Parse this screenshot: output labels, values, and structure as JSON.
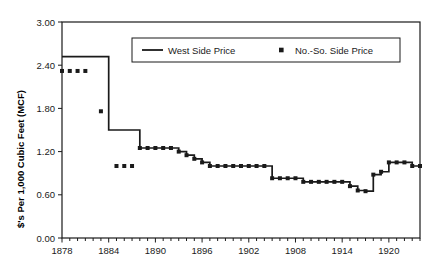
{
  "chart_data": {
    "type": "line",
    "title": "",
    "xlabel": "",
    "ylabel": "$'s Per 1,000 Cubic Feet (MCF)",
    "xlim": [
      1878,
      1924
    ],
    "ylim": [
      0.0,
      3.0
    ],
    "ytick_labels": [
      "0.00",
      "0.60",
      "1.20",
      "1.80",
      "2.40",
      "3.00"
    ],
    "ytick_values": [
      0.0,
      0.6,
      1.2,
      1.8,
      2.4,
      3.0
    ],
    "xtick_labels": [
      "1878",
      "1884",
      "1890",
      "1896",
      "1902",
      "1908",
      "1914",
      "1920"
    ],
    "xtick_values": [
      1878,
      1884,
      1890,
      1896,
      1902,
      1908,
      1914,
      1920
    ],
    "minor_xticks_every": 1,
    "grid": false,
    "legend_position": "top-center",
    "series": [
      {
        "name": "West Side Price",
        "style": "line",
        "color": "#1a1a1a",
        "x": [
          1878,
          1879,
          1880,
          1881,
          1882,
          1883,
          1884,
          1885,
          1886,
          1887,
          1888,
          1889,
          1890,
          1891,
          1892,
          1893,
          1894,
          1895,
          1896,
          1897,
          1898,
          1899,
          1900,
          1901,
          1902,
          1903,
          1904,
          1905,
          1906,
          1907,
          1908,
          1909,
          1910,
          1911,
          1912,
          1913,
          1914,
          1915,
          1916,
          1917,
          1918,
          1919,
          1920,
          1921,
          1922,
          1923,
          1924
        ],
        "y": [
          2.52,
          2.52,
          2.52,
          2.52,
          2.52,
          2.52,
          1.5,
          1.5,
          1.5,
          1.5,
          1.25,
          1.25,
          1.25,
          1.25,
          1.25,
          1.2,
          1.15,
          1.1,
          1.05,
          1.0,
          1.0,
          1.0,
          1.0,
          1.0,
          1.0,
          1.0,
          1.0,
          0.83,
          0.83,
          0.83,
          0.83,
          0.78,
          0.78,
          0.78,
          0.78,
          0.78,
          0.78,
          0.72,
          0.66,
          0.65,
          0.88,
          0.92,
          1.05,
          1.05,
          1.05,
          1.0,
          1.0
        ]
      },
      {
        "name": "No.-So. Side Price",
        "style": "square-markers",
        "color": "#1a1a1a",
        "x": [
          1878,
          1879,
          1880,
          1881,
          1883,
          1885,
          1886,
          1887,
          1888,
          1889,
          1890,
          1891,
          1892,
          1893,
          1894,
          1895,
          1896,
          1897,
          1898,
          1899,
          1900,
          1901,
          1902,
          1903,
          1904,
          1905,
          1906,
          1907,
          1908,
          1909,
          1910,
          1911,
          1912,
          1913,
          1914,
          1915,
          1916,
          1917,
          1918,
          1919,
          1920,
          1921,
          1922,
          1923,
          1924
        ],
        "y": [
          2.32,
          2.32,
          2.32,
          2.32,
          1.76,
          1.0,
          1.0,
          1.0,
          1.25,
          1.25,
          1.25,
          1.25,
          1.25,
          1.2,
          1.15,
          1.1,
          1.05,
          1.0,
          1.0,
          1.0,
          1.0,
          1.0,
          1.0,
          1.0,
          1.0,
          0.83,
          0.83,
          0.83,
          0.83,
          0.78,
          0.78,
          0.78,
          0.78,
          0.78,
          0.78,
          0.72,
          0.66,
          0.65,
          0.88,
          0.92,
          1.05,
          1.05,
          1.05,
          1.0,
          1.0
        ]
      }
    ],
    "legend": [
      {
        "label": "West Side Price",
        "marker": "line"
      },
      {
        "label": "No.-So. Side Price",
        "marker": "square"
      }
    ]
  },
  "axis": {
    "y_title": "$'s Per 1,000 Cubic Feet (MCF)"
  }
}
